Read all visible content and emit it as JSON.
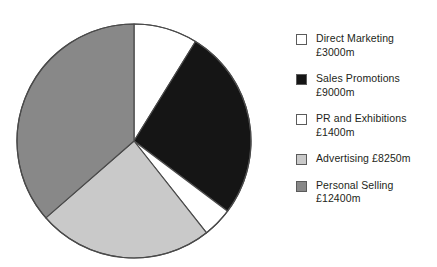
{
  "chart_data": {
    "type": "pie",
    "title": "",
    "subtitle": "",
    "xlabel": "",
    "ylabel": "",
    "currency": "£",
    "unit": "m",
    "total": 34050,
    "total_label": "£34050m",
    "legend_position": "right",
    "grid": false,
    "start_angle_deg": 0,
    "direction": "clockwise",
    "categories": [
      "Direct Marketing",
      "Sales Promotions",
      "PR and Exhibitions",
      "Advertising",
      "Personal Selling"
    ],
    "values": [
      3000,
      9000,
      1400,
      8250,
      12400
    ],
    "value_labels": [
      "£3000m",
      "£9000m",
      "£1400m",
      "£8250m",
      "£12400m"
    ],
    "colors": [
      "#ffffff",
      "#151515",
      "#ffffff",
      "#c9c9c9",
      "#888888"
    ],
    "slices": [
      {
        "label": "Direct Marketing",
        "value": 3000,
        "value_label": "£3000m",
        "color": "#ffffff",
        "percent": 8.8,
        "start_angle": 0,
        "end_angle": 31.7
      },
      {
        "label": "Sales Promotions",
        "value": 9000,
        "value_label": "£9000m",
        "color": "#151515",
        "percent": 26.4,
        "start_angle": 31.7,
        "end_angle": 126.9
      },
      {
        "label": "PR and Exhibitions",
        "value": 1400,
        "value_label": "£1400m",
        "color": "#ffffff",
        "percent": 4.1,
        "start_angle": 126.9,
        "end_angle": 141.7
      },
      {
        "label": "Advertising",
        "value": 8250,
        "value_label": "£8250m",
        "color": "#c9c9c9",
        "percent": 24.2,
        "start_angle": 141.7,
        "end_angle": 228.9
      },
      {
        "label": "Personal Selling",
        "value": 12400,
        "value_label": "£12400m",
        "color": "#888888",
        "percent": 36.4,
        "start_angle": 228.9,
        "end_angle": 360
      }
    ]
  },
  "legend": {
    "items": [
      {
        "label": "Direct Marketing",
        "text": "Direct Marketing\n£3000m",
        "swatch": "#ffffff"
      },
      {
        "label": "Sales Promotions",
        "text": "Sales Promotions\n£9000m",
        "swatch": "#151515"
      },
      {
        "label": "PR and Exhibitions",
        "text": "PR and Exhibitions\n£1400m",
        "swatch": "#ffffff"
      },
      {
        "label": "Advertising",
        "text": "Advertising £8250m",
        "swatch": "#c9c9c9"
      },
      {
        "label": "Personal Selling",
        "text": "Personal Selling\n£12400m",
        "swatch": "#888888"
      }
    ]
  },
  "style": {
    "background": "#ffffff",
    "outline": "#4a4a4a",
    "text": "#231f20"
  }
}
